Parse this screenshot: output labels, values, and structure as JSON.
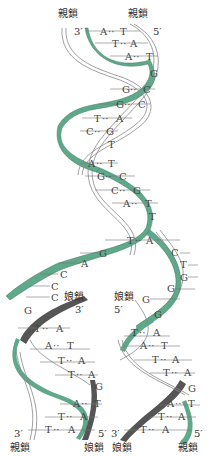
{
  "colors": {
    "parent_strand": "#5fa88a",
    "daughter_strand": "#555555",
    "outline": "#888888"
  },
  "labels": {
    "parent": "親鎖",
    "daughter": "娘鎖",
    "three_prime": "3′",
    "five_prime": "5′"
  },
  "top": {
    "left_label": "親鎖",
    "right_label": "親鎖",
    "left_end": "3′",
    "right_end": "5′"
  },
  "parent_pairs": [
    {
      "l": "A",
      "r": "T"
    },
    {
      "l": "T",
      "r": "A"
    },
    {
      "l": "A",
      "r": "T"
    },
    {
      "l": "",
      "r": "G"
    },
    {
      "l": "G",
      "r": "C"
    },
    {
      "l": "G",
      "r": "C"
    },
    {
      "l": "T",
      "r": "A"
    },
    {
      "l": "C",
      "r": "G"
    },
    {
      "l": "",
      "r": "T"
    },
    {
      "l": "A",
      "r": "T"
    },
    {
      "l": "G",
      "r": "C"
    },
    {
      "l": "C",
      "r": "G"
    },
    {
      "l": "A",
      "r": "T"
    },
    {
      "l": "",
      "r": "T"
    },
    {
      "l": "T",
      "r": "A"
    }
  ],
  "fork_left_bases": [
    "G",
    "A",
    "C",
    "C",
    "C"
  ],
  "fork_right_bases": [
    "C",
    "T",
    "G",
    "G",
    "G"
  ],
  "left_daughter": {
    "label": "娘鎖",
    "end": "3′",
    "pairs": [
      {
        "l": "G",
        "r": ""
      },
      {
        "l": "T",
        "r": "A"
      },
      {
        "l": "A",
        "r": "T"
      },
      {
        "l": "T",
        "r": "A"
      },
      {
        "l": "T",
        "r": "A"
      },
      {
        "l": "",
        "r": "G"
      },
      {
        "l": "A",
        "r": "T"
      },
      {
        "l": "T",
        "r": "A"
      },
      {
        "l": "T",
        "r": "A"
      }
    ],
    "bottom_left_end": "3′",
    "bottom_left_label": "親鎖",
    "bottom_right_end": "5′",
    "bottom_right_label": "娘鎖"
  },
  "right_daughter": {
    "label": "娘鎖",
    "end": "5′",
    "pairs": [
      {
        "l": "G",
        "r": ""
      },
      {
        "l": "T",
        "r": "A"
      },
      {
        "l": "A",
        "r": "T"
      },
      {
        "l": "T",
        "r": "A"
      },
      {
        "l": "T",
        "r": "A"
      },
      {
        "l": "",
        "r": "G"
      },
      {
        "l": "A",
        "r": "T"
      },
      {
        "l": "T",
        "r": "A"
      },
      {
        "l": "T",
        "r": "A"
      }
    ],
    "bottom_left_end": "3′",
    "bottom_left_label": "娘鎖",
    "bottom_right_end": "5′",
    "bottom_right_label": "親鎖"
  }
}
